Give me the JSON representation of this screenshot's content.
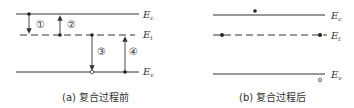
{
  "panel_a": {
    "caption": "(a) 复合过程前",
    "levels": [
      {
        "name": "E",
        "sub": "c"
      },
      {
        "name": "E",
        "sub": "t"
      },
      {
        "name": "E",
        "sub": "v"
      }
    ],
    "processes": [
      "①",
      "②",
      "③",
      "④"
    ]
  },
  "panel_b": {
    "caption": "(b) 复合过程后",
    "levels": [
      {
        "name": "E",
        "sub": "c"
      },
      {
        "name": "E",
        "sub": "t"
      },
      {
        "name": "E",
        "sub": "v"
      }
    ]
  },
  "colors": {
    "line": "#333333",
    "background": "#ffffff"
  }
}
